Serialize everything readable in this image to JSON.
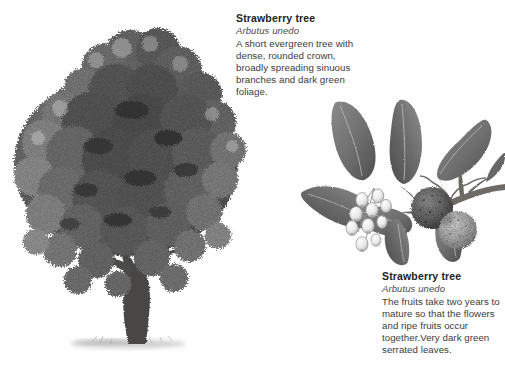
{
  "page": {
    "background_color": "#fefefe",
    "width": 505,
    "height": 370
  },
  "palette": {
    "text_heading": "#232323",
    "text_latin": "#4a4a4a",
    "text_body": "#3b3b3b",
    "foliage_dark": "#3a3a3a",
    "foliage_mid": "#6f6f6f",
    "foliage_light": "#9a9a9a",
    "trunk": "#4a4744",
    "leaf_fill": "#767676",
    "leaf_shadow": "#515151",
    "flower_fill": "#f2f2f2",
    "flower_outline": "#8d8d8d",
    "fruit_dark": "#5d5d5d",
    "fruit_light": "#a5a5a5",
    "ground_shadow": "#c9c9c9"
  },
  "captions": {
    "top": {
      "common_name": "Strawberry tree",
      "latin_name": "Arbutus unedo",
      "description": "A short evergreen tree with dense, rounded crown, broadly spreading sinuous branches and dark green foliage."
    },
    "bottom": {
      "common_name": "Strawberry tree",
      "latin_name": "Arbutus unedo",
      "description": "The fruits take two years to mature so that the flowers and ripe fruits occur together.Very dark green serrated leaves."
    }
  },
  "illustrations": {
    "tree": {
      "name": "whole-tree-engraving",
      "subject": "Strawberry tree habit",
      "style": "grayscale stipple engraving",
      "features": [
        "dense broadly rounded crown",
        "sinuous spreading branches",
        "short thick trunk",
        "ground shadow at base"
      ]
    },
    "branch": {
      "name": "fruiting-branch-engraving",
      "subject": "Arbutus unedo shoot with flowers and fruit",
      "style": "grayscale stipple engraving",
      "features": [
        "elliptical serrated leaves with midribs",
        "pendulous cluster of white bell flowers",
        "two warty globose fruits",
        "woody stem running to right edge"
      ],
      "counts": {
        "leaves": 7,
        "flowers": 9,
        "fruits": 2
      }
    }
  }
}
